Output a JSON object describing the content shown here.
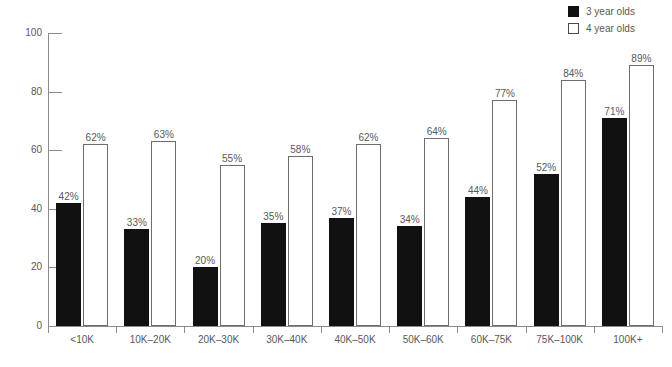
{
  "chart_data": {
    "type": "bar",
    "title": "",
    "subtitle": "",
    "xlabel": "",
    "ylabel": "",
    "ylim": [
      0,
      100
    ],
    "yticks": [
      0,
      20,
      40,
      60,
      80,
      100
    ],
    "grid": false,
    "legend_position": "top-right",
    "categories": [
      "<10K",
      "10K–20K",
      "20K–30K",
      "30K–40K",
      "40K–50K",
      "50K–60K",
      "60K–75K",
      "75K–100K",
      "100K+"
    ],
    "series": [
      {
        "name": "3 year olds",
        "color": "#111111",
        "style": "filled",
        "values": [
          42,
          33,
          20,
          35,
          37,
          34,
          44,
          52,
          71
        ],
        "labels": [
          "42%",
          "33%",
          "20%",
          "35%",
          "37%",
          "34%",
          "44%",
          "52%",
          "71%"
        ]
      },
      {
        "name": "4 year olds",
        "color": "#ffffff",
        "style": "hollow",
        "values": [
          62,
          63,
          55,
          58,
          62,
          64,
          77,
          84,
          89
        ],
        "labels": [
          "62%",
          "63%",
          "55%",
          "58%",
          "62%",
          "64%",
          "77%",
          "84%",
          "89%"
        ]
      }
    ]
  },
  "axis": {
    "y_tick_labels": [
      "0",
      "20",
      "40",
      "60",
      "80",
      "100"
    ]
  },
  "legend": {
    "items": [
      {
        "label": "3 year olds",
        "swatch": "filled"
      },
      {
        "label": "4 year olds",
        "swatch": "hollow"
      }
    ]
  },
  "footer": {
    "cut_off_text": ""
  }
}
